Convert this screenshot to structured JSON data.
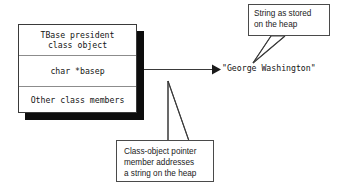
{
  "figure": {
    "type": "object-memory-diagram",
    "background_color": "#ffffff",
    "line_color": "#3a3a3a",
    "shadow_color": "#0d0d0d"
  },
  "class_box": {
    "name": "TBase president class object",
    "shadow": true,
    "rows": [
      {
        "id": "header",
        "text": "TBase president\nclass object"
      },
      {
        "id": "pointer-member",
        "text": "char *basep"
      },
      {
        "id": "other-members",
        "text": "Other class members"
      }
    ]
  },
  "heap": {
    "string_literal": "\"George Washington\""
  },
  "callouts": [
    {
      "id": "heap-string-callout",
      "text": "String as stored\non the heap",
      "points_to": "heap-string"
    },
    {
      "id": "pointer-member-callout",
      "text": "Class-object pointer\nmember addresses\na string on the heap",
      "points_to": "pointer-member-row"
    }
  ],
  "connectors": [
    {
      "id": "basep-to-string",
      "from": "char *basep",
      "to": "\"George Washington\"",
      "arrowhead": "filled-triangle"
    }
  ]
}
